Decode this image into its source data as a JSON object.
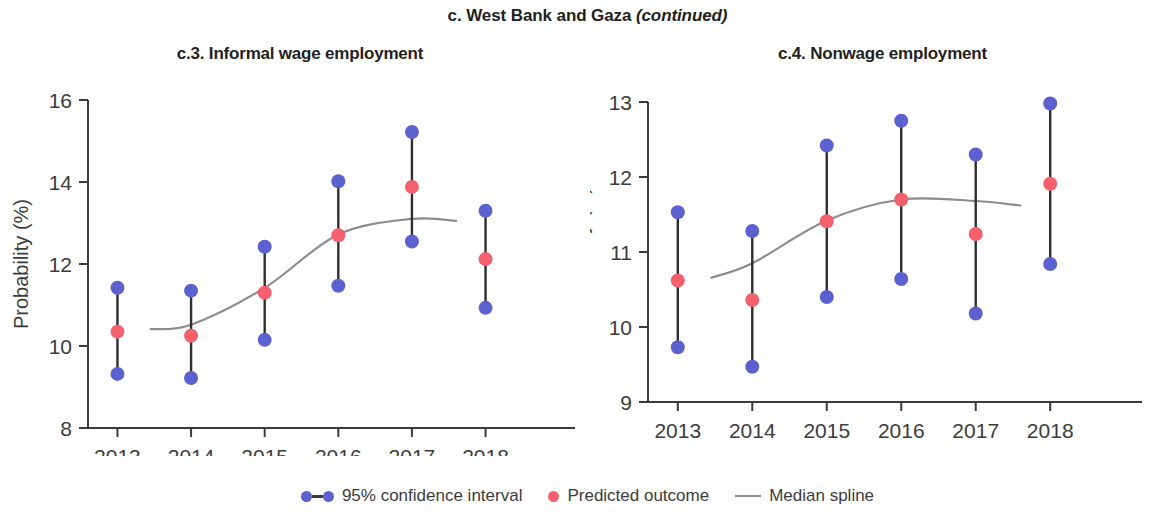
{
  "figure": {
    "main_title_prefix": "c. West Bank and Gaza ",
    "main_title_continued": "(continued)"
  },
  "legend": {
    "items": [
      {
        "key": "ci",
        "label": "95% confidence interval",
        "icon": "dot-bar-dot-icon",
        "color": "#5b62d0"
      },
      {
        "key": "pred",
        "label": "Predicted outcome",
        "icon": "dot-icon",
        "color": "#f4606c"
      },
      {
        "key": "spline",
        "label": "Median spline",
        "icon": "line-icon",
        "color": "#8c8c8c"
      }
    ]
  },
  "chart_data": [
    {
      "id": "c3",
      "type": "scatter",
      "title": "c.3. Informal wage employment",
      "xlabel": "",
      "ylabel": "Probability (%)",
      "categories": [
        "2013",
        "2014",
        "2015",
        "2016",
        "2017",
        "2018"
      ],
      "x": [
        2013,
        2014,
        2015,
        2016,
        2017,
        2018
      ],
      "xlim": [
        2012.6,
        2018.4
      ],
      "ylim": [
        8,
        16
      ],
      "yticks": [
        8,
        10,
        12,
        14,
        16
      ],
      "grid": false,
      "legend_position": "bottom",
      "series": [
        {
          "name": "Predicted outcome",
          "color": "#f4606c",
          "values": [
            10.35,
            10.25,
            11.3,
            12.7,
            13.88,
            12.12
          ]
        },
        {
          "name": "95% confidence interval upper",
          "color": "#5b62d0",
          "values": [
            11.42,
            11.35,
            12.42,
            14.02,
            15.22,
            13.3
          ]
        },
        {
          "name": "95% confidence interval lower",
          "color": "#5b62d0",
          "values": [
            9.32,
            9.22,
            10.15,
            11.47,
            12.55,
            10.93
          ]
        },
        {
          "name": "Median spline",
          "color": "#8c8c8c",
          "values": [
            10.32,
            10.52,
            11.42,
            12.72,
            13.1,
            13.02
          ]
        }
      ]
    },
    {
      "id": "c4",
      "type": "scatter",
      "title": "c.4. Nonwage employment",
      "xlabel": "",
      "ylabel": "Probability (%)",
      "categories": [
        "2013",
        "2014",
        "2015",
        "2016",
        "2017",
        "2018"
      ],
      "x": [
        2013,
        2014,
        2015,
        2016,
        2017,
        2018
      ],
      "xlim": [
        2012.6,
        2018.4
      ],
      "ylim": [
        9,
        13
      ],
      "yticks": [
        9,
        10,
        11,
        12,
        13
      ],
      "grid": false,
      "legend_position": "bottom",
      "series": [
        {
          "name": "Predicted outcome",
          "color": "#f4606c",
          "values": [
            10.62,
            10.36,
            11.41,
            11.7,
            11.24,
            11.91
          ]
        },
        {
          "name": "95% confidence interval upper",
          "color": "#5b62d0",
          "values": [
            11.53,
            11.28,
            12.42,
            12.75,
            12.3,
            12.98
          ]
        },
        {
          "name": "95% confidence interval lower",
          "color": "#5b62d0",
          "values": [
            9.73,
            9.47,
            10.4,
            10.64,
            10.18,
            10.84
          ]
        },
        {
          "name": "Median spline",
          "color": "#8c8c8c",
          "values": [
            10.5,
            10.85,
            11.42,
            11.7,
            11.68,
            11.58
          ]
        }
      ]
    }
  ]
}
